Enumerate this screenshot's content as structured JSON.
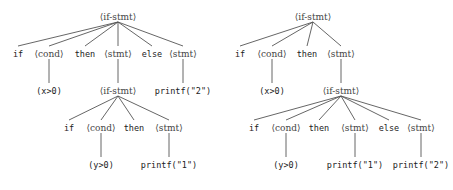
{
  "diagram": {
    "style": {
      "edge_color": "#555555",
      "nonterminal_color": "#444444",
      "terminal_color": "#222222"
    },
    "trees": [
      {
        "name": "left-tree",
        "nodes": [
          {
            "id": "L0",
            "label": "⟨if-stmt⟩",
            "kind": "nt",
            "x": 118,
            "y": 17
          },
          {
            "id": "L1",
            "label": "if",
            "kind": "t",
            "x": 18,
            "y": 54
          },
          {
            "id": "L2",
            "label": "⟨cond⟩",
            "kind": "nt",
            "x": 49,
            "y": 54
          },
          {
            "id": "L3",
            "label": "then",
            "kind": "t",
            "x": 85,
            "y": 54
          },
          {
            "id": "L4",
            "label": "⟨stmt⟩",
            "kind": "nt",
            "x": 118,
            "y": 54
          },
          {
            "id": "L5",
            "label": "else",
            "kind": "t",
            "x": 152,
            "y": 54
          },
          {
            "id": "L6",
            "label": "⟨stmt⟩",
            "kind": "nt",
            "x": 183,
            "y": 54
          },
          {
            "id": "L7",
            "label": "(x>0)",
            "kind": "t",
            "x": 49,
            "y": 91
          },
          {
            "id": "L8",
            "label": "⟨if-stmt⟩",
            "kind": "nt",
            "x": 118,
            "y": 91
          },
          {
            "id": "L9",
            "label": "printf(\"2\")",
            "kind": "t",
            "x": 183,
            "y": 91
          },
          {
            "id": "L10",
            "label": "if",
            "kind": "t",
            "x": 69,
            "y": 128
          },
          {
            "id": "L11",
            "label": "⟨cond⟩",
            "kind": "nt",
            "x": 101,
            "y": 128
          },
          {
            "id": "L12",
            "label": "then",
            "kind": "t",
            "x": 134,
            "y": 128
          },
          {
            "id": "L13",
            "label": "⟨stmt⟩",
            "kind": "nt",
            "x": 169,
            "y": 128
          },
          {
            "id": "L14",
            "label": "(y>0)",
            "kind": "t",
            "x": 101,
            "y": 165
          },
          {
            "id": "L15",
            "label": "printf(\"1\")",
            "kind": "t",
            "x": 169,
            "y": 165
          }
        ],
        "edges": [
          [
            "L0",
            "L1"
          ],
          [
            "L0",
            "L2"
          ],
          [
            "L0",
            "L3"
          ],
          [
            "L0",
            "L4"
          ],
          [
            "L0",
            "L5"
          ],
          [
            "L0",
            "L6"
          ],
          [
            "L2",
            "L7"
          ],
          [
            "L4",
            "L8"
          ],
          [
            "L6",
            "L9"
          ],
          [
            "L8",
            "L10"
          ],
          [
            "L8",
            "L11"
          ],
          [
            "L8",
            "L12"
          ],
          [
            "L8",
            "L13"
          ],
          [
            "L11",
            "L14"
          ],
          [
            "L13",
            "L15"
          ]
        ]
      },
      {
        "name": "right-tree",
        "nodes": [
          {
            "id": "R0",
            "label": "⟨if-stmt⟩",
            "kind": "nt",
            "x": 313,
            "y": 17
          },
          {
            "id": "R1",
            "label": "if",
            "kind": "t",
            "x": 240,
            "y": 54
          },
          {
            "id": "R2",
            "label": "⟨cond⟩",
            "kind": "nt",
            "x": 272,
            "y": 54
          },
          {
            "id": "R3",
            "label": "then",
            "kind": "t",
            "x": 307,
            "y": 54
          },
          {
            "id": "R4",
            "label": "⟨stmt⟩",
            "kind": "nt",
            "x": 341,
            "y": 54
          },
          {
            "id": "R5",
            "label": "(x>0)",
            "kind": "t",
            "x": 272,
            "y": 91
          },
          {
            "id": "R6",
            "label": "⟨if-stmt⟩",
            "kind": "nt",
            "x": 341,
            "y": 91
          },
          {
            "id": "R7",
            "label": "if",
            "kind": "t",
            "x": 254,
            "y": 128
          },
          {
            "id": "R8",
            "label": "⟨cond⟩",
            "kind": "nt",
            "x": 286,
            "y": 128
          },
          {
            "id": "R9",
            "label": "then",
            "kind": "t",
            "x": 319,
            "y": 128
          },
          {
            "id": "R10",
            "label": "⟨stmt⟩",
            "kind": "nt",
            "x": 355,
            "y": 128
          },
          {
            "id": "R11",
            "label": "else",
            "kind": "t",
            "x": 389,
            "y": 128
          },
          {
            "id": "R12",
            "label": "⟨stmt⟩",
            "kind": "nt",
            "x": 421,
            "y": 128
          },
          {
            "id": "R13",
            "label": "(y>0)",
            "kind": "t",
            "x": 286,
            "y": 165
          },
          {
            "id": "R14",
            "label": "printf(\"1\")",
            "kind": "t",
            "x": 355,
            "y": 165
          },
          {
            "id": "R15",
            "label": "printf(\"2\")",
            "kind": "t",
            "x": 421,
            "y": 165
          }
        ],
        "edges": [
          [
            "R0",
            "R1"
          ],
          [
            "R0",
            "R2"
          ],
          [
            "R0",
            "R3"
          ],
          [
            "R0",
            "R4"
          ],
          [
            "R2",
            "R5"
          ],
          [
            "R4",
            "R6"
          ],
          [
            "R6",
            "R7"
          ],
          [
            "R6",
            "R8"
          ],
          [
            "R6",
            "R9"
          ],
          [
            "R6",
            "R10"
          ],
          [
            "R6",
            "R11"
          ],
          [
            "R6",
            "R12"
          ],
          [
            "R8",
            "R13"
          ],
          [
            "R10",
            "R14"
          ],
          [
            "R12",
            "R15"
          ]
        ]
      }
    ]
  }
}
